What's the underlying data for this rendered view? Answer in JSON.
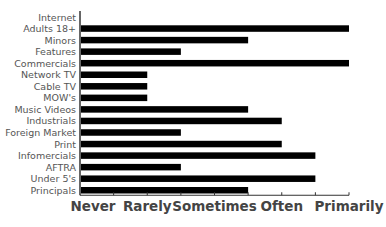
{
  "chart_data": {
    "type": "bar",
    "orientation": "horizontal",
    "title": "",
    "xlabel": "",
    "ylabel": "",
    "categories": [
      "Internet",
      "Adults 18+",
      "Minors",
      "Features",
      "Commercials",
      "Network TV",
      "Cable TV",
      "MOW's",
      "Music Videos",
      "Industrials",
      "Foreign Market",
      "Print",
      "Infomercials",
      "AFTRA",
      "Under 5's",
      "Principals"
    ],
    "values": [
      0,
      4,
      2.5,
      1.5,
      4,
      1,
      1,
      1,
      2.5,
      3,
      1.5,
      3,
      3.5,
      1.5,
      3.5,
      2.5
    ],
    "xlim": [
      0,
      4
    ],
    "x_tick_values": [
      0,
      1,
      2,
      3,
      4
    ],
    "x_tick_labels": [
      "Never",
      "Rarely",
      "Sometimes",
      "Often",
      "Primarily"
    ],
    "minor_tick_step": 0.5,
    "grid": false,
    "legend": "none",
    "bar_color": "#000000"
  }
}
